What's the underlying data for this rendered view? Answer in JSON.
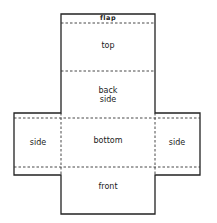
{
  "diagram": {
    "type": "box-net",
    "stroke_color": "#222222",
    "panels": [
      {
        "id": "flap",
        "label": "flap"
      },
      {
        "id": "top",
        "label": "top"
      },
      {
        "id": "back-side",
        "label": "back\nside"
      },
      {
        "id": "side-left",
        "label": "side"
      },
      {
        "id": "bottom",
        "label": "bottom"
      },
      {
        "id": "side-right",
        "label": "side"
      },
      {
        "id": "front",
        "label": "front"
      }
    ]
  }
}
